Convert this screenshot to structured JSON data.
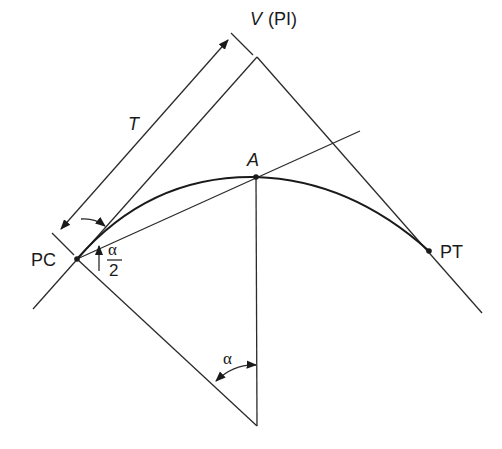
{
  "diagram": {
    "type": "circular-curve-geometry",
    "labels": {
      "vertex": "V",
      "vertex_paren": "(PI)",
      "tangent_length": "T",
      "midpoint": "A",
      "point_of_curvature": "PC",
      "point_of_tangency": "PT",
      "half_angle_num": "α",
      "half_angle_den": "2",
      "central_angle": "α"
    },
    "points": {
      "V": [
        257,
        57
      ],
      "PC": [
        77,
        259
      ],
      "A": [
        256,
        177
      ],
      "PT": [
        429,
        251
      ],
      "O": [
        257,
        426
      ]
    },
    "colors": {
      "line": "#2b2b2b",
      "background": "#ffffff"
    }
  }
}
